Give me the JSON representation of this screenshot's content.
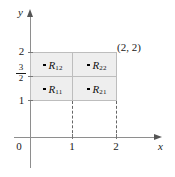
{
  "figure": {
    "type": "coordinate-grid-diagram",
    "background_color": "#ffffff",
    "region_fill_color": "#eeeeee",
    "grid_line_color": "#bdbdbd",
    "axis_color": "#8e8e8e"
  },
  "axes": {
    "x_axis_label": "x",
    "y_axis_label": "y",
    "origin_label": "0",
    "x_ticks": [
      {
        "value": "1"
      },
      {
        "value": "2"
      }
    ],
    "y_ticks": [
      {
        "value": "1"
      },
      {
        "value": "2"
      }
    ],
    "y_fraction_tick": {
      "numerator": "3",
      "denominator": "2"
    }
  },
  "region": {
    "corner_point_label": "(2, 2)",
    "cells": [
      {
        "id": "R12",
        "name": "R",
        "subscript": "12"
      },
      {
        "id": "R22",
        "name": "R",
        "subscript": "22"
      },
      {
        "id": "R11",
        "name": "R",
        "subscript": "11"
      },
      {
        "id": "R21",
        "name": "R",
        "subscript": "21"
      }
    ]
  }
}
